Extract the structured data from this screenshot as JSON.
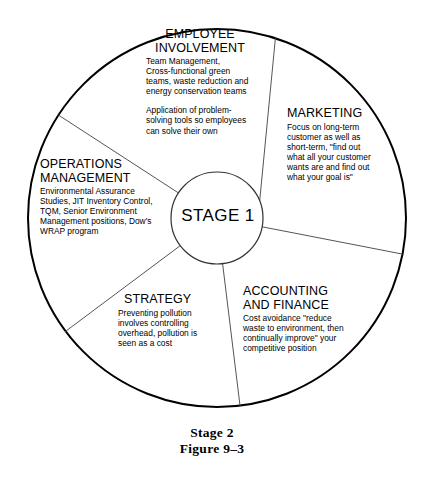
{
  "figure": {
    "hub_label": "STAGE 1",
    "outer_label": "Stage 2",
    "figure_number": "Figure 9–3"
  },
  "segments": [
    {
      "id": "employee-involvement",
      "title": "EMPLOYEE\nINVOLVEMENT",
      "body1": "Team Management,\nCross-functional green\nteams, waste reduction and\nenergy conservation teams",
      "body2": "Application of problem-\nsolving tools so employees\ncan solve their own"
    },
    {
      "id": "marketing",
      "title": "MARKETING",
      "body1": "Focus on long-term\ncustomer as well as\nshort-term, \"find out\nwhat all your customer\nwants are and find out\nwhat your goal is\"",
      "body2": ""
    },
    {
      "id": "operations-management",
      "title": "OPERATIONS\nMANAGEMENT",
      "body1": "Environmental Assurance\nStudies, JIT Inventory Control,\nTQM, Senior Environment\nManagement positions, Dow's\nWRAP program",
      "body2": ""
    },
    {
      "id": "strategy",
      "title": "STRATEGY",
      "body1": "Preventing pollution\ninvolves controlling\noverhead, pollution is\nseen as a cost",
      "body2": ""
    },
    {
      "id": "accounting-finance",
      "title": "ACCOUNTING\nAND FINANCE",
      "body1": "Cost avoidance \"reduce\nwaste to environment, then\ncontinually improve\" your\ncompetitive position",
      "body2": ""
    }
  ],
  "colors": {
    "outer_stroke": "#000000",
    "spoke_stroke": "#555555",
    "hub_stroke": "#333333",
    "background": "#ffffff",
    "text": "#000000"
  }
}
